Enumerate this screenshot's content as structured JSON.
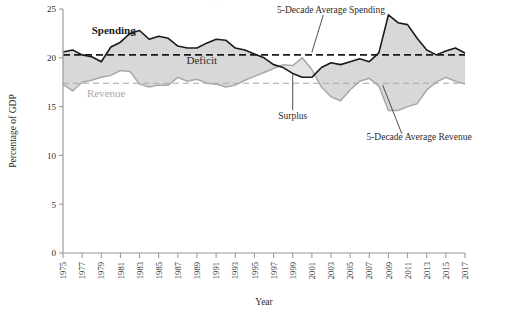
{
  "chart_data": {
    "type": "area",
    "title": "",
    "xlabel": "Year",
    "ylabel": "Percentage of GDP",
    "xlim": [
      1975,
      2017
    ],
    "ylim": [
      0,
      25
    ],
    "y_ticks": [
      0,
      5,
      10,
      15,
      20,
      25
    ],
    "x_ticks": [
      1975,
      1977,
      1979,
      1981,
      1983,
      1985,
      1987,
      1989,
      1991,
      1993,
      1995,
      1997,
      1999,
      2001,
      2003,
      2005,
      2007,
      2009,
      2011,
      2013,
      2015,
      2017
    ],
    "grid": false,
    "legend_position": "inline-annotations",
    "x": [
      1975,
      1976,
      1977,
      1978,
      1979,
      1980,
      1981,
      1982,
      1983,
      1984,
      1985,
      1986,
      1987,
      1988,
      1989,
      1990,
      1991,
      1992,
      1993,
      1994,
      1995,
      1996,
      1997,
      1998,
      1999,
      2000,
      2001,
      2002,
      2003,
      2004,
      2005,
      2006,
      2007,
      2008,
      2009,
      2010,
      2011,
      2012,
      2013,
      2014,
      2015,
      2016,
      2017
    ],
    "series": [
      {
        "name": "Spending",
        "color": "#1a1a1a",
        "values": [
          20.6,
          20.8,
          20.3,
          20.1,
          19.6,
          21.1,
          21.6,
          22.5,
          22.8,
          21.9,
          22.2,
          22.0,
          21.2,
          21.0,
          21.0,
          21.5,
          21.9,
          21.8,
          21.0,
          20.8,
          20.4,
          20.0,
          19.3,
          19.0,
          18.4,
          18.0,
          18.0,
          19.0,
          19.5,
          19.3,
          19.6,
          19.9,
          19.6,
          20.5,
          24.4,
          23.6,
          23.4,
          22.0,
          20.8,
          20.3,
          20.7,
          21.0,
          20.5
        ]
      },
      {
        "name": "Revenue",
        "color": "#a8a8a8",
        "values": [
          17.3,
          16.6,
          17.5,
          17.7,
          18.0,
          18.2,
          18.7,
          18.6,
          17.3,
          17.0,
          17.2,
          17.2,
          18.0,
          17.6,
          17.8,
          17.4,
          17.3,
          17.0,
          17.2,
          17.7,
          18.1,
          18.5,
          18.9,
          19.3,
          19.2,
          20.0,
          18.8,
          17.0,
          16.0,
          15.6,
          16.7,
          17.6,
          17.9,
          17.1,
          14.6,
          14.6,
          15.0,
          15.3,
          16.7,
          17.5,
          18.0,
          17.6,
          17.3
        ]
      }
    ],
    "reference_lines": [
      {
        "name": "5-Decade Average Spending",
        "value": 20.3,
        "color": "#1a1a1a",
        "style": "dashed"
      },
      {
        "name": "5-Decade Average Revenue",
        "value": 17.4,
        "color": "#a8a8a8",
        "style": "dashed"
      }
    ],
    "annotations": [
      {
        "name": "spending-series-label",
        "text": "Spending",
        "x": 1978.0,
        "y": 22.4
      },
      {
        "name": "revenue-series-label",
        "text": "Revenue",
        "x": 1977.5,
        "y": 16.0
      },
      {
        "name": "deficit-region-label",
        "text": "Deficit",
        "x": 1989.5,
        "y": 19.4
      },
      {
        "name": "surplus-region-label",
        "text": "Surplus",
        "x": 1999.0,
        "y": 13.7
      },
      {
        "name": "avg-spending-annotation",
        "text": "5-Decade Average Spending",
        "x": 2003.0,
        "y": 24.6
      },
      {
        "name": "avg-revenue-annotation",
        "text": "5-Decade Average Revenue",
        "x": 2012.2,
        "y": 11.6
      }
    ],
    "fill_colors": {
      "deficit": "#d8d8d8",
      "surplus": "#e4e4e4"
    },
    "axis_color": "#9a9a9a"
  }
}
